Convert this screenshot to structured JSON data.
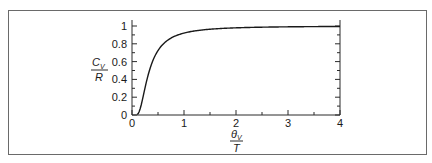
{
  "chart_data": {
    "type": "line",
    "title": "",
    "xlabel": {
      "numerator": "θ",
      "numerator_sub": "V",
      "denominator": "T"
    },
    "ylabel": {
      "numerator": "C",
      "numerator_sub": "V",
      "denominator": "R"
    },
    "xlim": [
      0,
      4
    ],
    "ylim": [
      0,
      1
    ],
    "x_ticks": [
      0,
      1,
      2,
      3,
      4
    ],
    "x_tick_labels": [
      "0",
      "1",
      "2",
      "3",
      "4"
    ],
    "x_minor_ticks": [
      0.5,
      1.5,
      2.5,
      3.5
    ],
    "y_ticks": [
      0,
      0.2,
      0.4,
      0.6,
      0.8,
      1
    ],
    "y_tick_labels": [
      "0",
      "0.2",
      "0.4",
      "0.6",
      "0.8",
      "1"
    ],
    "y_minor_ticks": [
      0.1,
      0.3,
      0.5,
      0.7,
      0.9
    ],
    "grid": false,
    "legend": "none",
    "series": [
      {
        "name": "heat capacity",
        "x": [
          0.1,
          0.15,
          0.2,
          0.25,
          0.3,
          0.4,
          0.5,
          0.6,
          0.7,
          0.8,
          1.0,
          1.25,
          1.5,
          2.0,
          2.5,
          3.0,
          3.5,
          4.0
        ],
        "y": [
          0.0045,
          0.0284,
          0.0452,
          0.1419,
          0.2245,
          0.4282,
          0.7241,
          0.7864,
          0.836,
          0.872,
          0.9207,
          0.948,
          0.9638,
          0.9794,
          0.9868,
          0.9908,
          0.9932,
          0.9948
        ]
      }
    ]
  }
}
